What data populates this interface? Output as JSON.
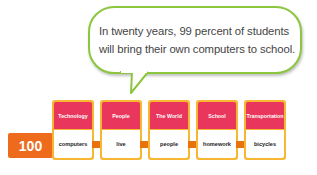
{
  "speech_bubble": {
    "line1": "In twenty years, 99 percent of students",
    "line2": "will bring their own computers to school."
  },
  "score": {
    "value": "100"
  },
  "cards": [
    {
      "category": "Technology",
      "word": "computers"
    },
    {
      "category": "People",
      "word": "live"
    },
    {
      "category": "The World",
      "word": "people"
    },
    {
      "category": "School",
      "word": "homework"
    },
    {
      "category": "Transportation",
      "word": "bicycles"
    }
  ],
  "colors": {
    "bubble_border": "#8cc63f",
    "card_header": "#e8365d",
    "card_frame": "#f7b733",
    "score_badge": "#ee6b1e"
  }
}
